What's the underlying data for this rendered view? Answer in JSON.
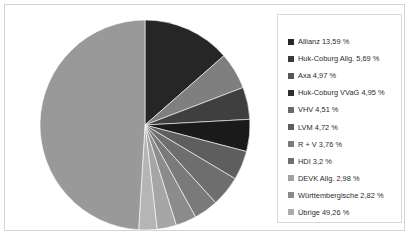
{
  "chart_data": {
    "type": "pie",
    "title": "",
    "subtitle": "",
    "xlabel": "",
    "ylabel": "",
    "legend_position": "right",
    "grid": false,
    "start_angle_deg": 0,
    "direction": "clockwise",
    "categories": [
      "Allianz",
      "Huk-Coburg Allg.",
      "Axa",
      "Huk-Coburg VVaG",
      "VHV",
      "LVM",
      "R + V",
      "HDI",
      "DEVK Allg.",
      "Württembergische",
      "Übrige"
    ],
    "values": [
      13.59,
      5.69,
      4.97,
      4.95,
      4.51,
      4.72,
      3.76,
      3.2,
      2.98,
      2.82,
      49.26
    ],
    "unit": "%",
    "slice_colors": [
      "#262626",
      "#7f7f7f",
      "#3f3f3f",
      "#1a1a1a",
      "#5e5e5e",
      "#6e6e6e",
      "#7a7a7a",
      "#8c8c8c",
      "#a6a6a6",
      "#b5b5b5",
      "#999999"
    ],
    "labels": [
      "Allianz 13,59 %",
      "Huk-Coburg Allg. 5,69 %",
      "Axa 4,97 %",
      "Huk-Coburg VVaG 4,95 %",
      "VHV 4,51 %",
      "LVM 4,72 %",
      "R + V 3,76 %",
      "HDI 3,2 %",
      "DEVK Allg.  2,98 %",
      "Württembergische 2,82 %",
      "Übrige 49,26 %"
    ]
  },
  "legend": {
    "entries": [
      {
        "label": "Allianz 13,59 %",
        "color": "#262626"
      },
      {
        "label": "Huk-Coburg Allg. 5,69 %",
        "color": "#3a3a3a"
      },
      {
        "label": "Axa 4,97 %",
        "color": "#585858"
      },
      {
        "label": "Huk-Coburg VVaG 4,95 %",
        "color": "#2e2e2e"
      },
      {
        "label": "VHV 4,51 %",
        "color": "#6a6a6a"
      },
      {
        "label": "LVM 4,72 %",
        "color": "#5e5e5e"
      },
      {
        "label": "R + V 3,76 %",
        "color": "#7c7c7c"
      },
      {
        "label": "HDI 3,2 %",
        "color": "#6f6f6f"
      },
      {
        "label": "DEVK Allg.  2,98 %",
        "color": "#a2a2a2"
      },
      {
        "label": "Württembergische 2,82 %",
        "color": "#8a8a8a"
      },
      {
        "label": "Übrige 49,26 %",
        "color": "#ababab"
      }
    ]
  },
  "frame": {
    "border_color": "#d4d4d4",
    "background": "#ffffff"
  }
}
